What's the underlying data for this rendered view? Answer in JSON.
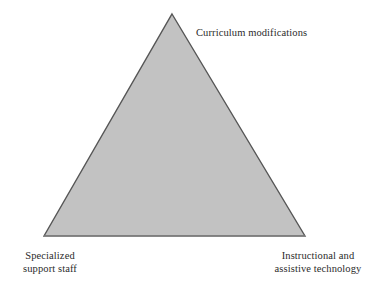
{
  "figure": {
    "type": "triangle-diagram",
    "background_color": "#ffffff",
    "shape": {
      "name": "equilateral-triangle",
      "fill_color": "#c2c2c2",
      "stroke_color": "#565656",
      "apex": [
        172,
        14
      ],
      "bottom_left": [
        44,
        236
      ],
      "bottom_right": [
        305,
        236
      ]
    },
    "labels": {
      "apex": {
        "lines": [
          "Curriculum modifications"
        ],
        "full_text": "Curriculum modifications",
        "position": "top-right-of-apex"
      },
      "bottom_left": {
        "lines": [
          "Specialized",
          "support staff"
        ],
        "full_text": "Specialized support staff",
        "position": "below-left-vertex"
      },
      "bottom_right": {
        "lines": [
          "Instructional and",
          "assistive technology"
        ],
        "full_text": "Instructional and assistive technology",
        "position": "below-right-vertex"
      }
    },
    "text_color": "#2b2b2b"
  }
}
